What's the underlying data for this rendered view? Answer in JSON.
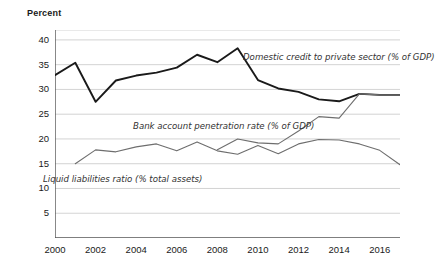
{
  "chart_data": {
    "type": "line",
    "title": "",
    "ylabel": "Percent",
    "xlabel": "",
    "ylim": [
      0,
      42
    ],
    "xlim": [
      2000,
      2017
    ],
    "grid": true,
    "legend_position": "inline-annotations",
    "yticks": [
      5,
      10,
      15,
      20,
      25,
      30,
      35,
      40
    ],
    "xticks": [
      2000,
      2002,
      2004,
      2006,
      2008,
      2010,
      2012,
      2014,
      2016
    ],
    "x": [
      2000,
      2001,
      2002,
      2003,
      2004,
      2005,
      2006,
      2007,
      2008,
      2009,
      2010,
      2011,
      2012,
      2013,
      2014,
      2015,
      2016,
      2017
    ],
    "series": [
      {
        "name": "Domestic credit to private sector (% of GDP)",
        "color": "#1a1a1a",
        "width": 1.9,
        "values": [
          32.9,
          35.4,
          27.5,
          31.8,
          32.8,
          33.4,
          34.4,
          37.0,
          35.5,
          38.3,
          31.9,
          30.2,
          29.5,
          28.0,
          27.6,
          29.1,
          28.9,
          28.9
        ]
      },
      {
        "name": "Bank account penetration rate (% of GDP)",
        "color": "#6e6e6e",
        "width": 1.1,
        "values": [
          null,
          null,
          null,
          null,
          null,
          null,
          null,
          null,
          17.8,
          20.0,
          19.2,
          19.0,
          21.6,
          24.5,
          24.2,
          29.1,
          28.9,
          28.9
        ]
      },
      {
        "name": "Liquid liabilities ratio (% total assets)",
        "color": "#6e6e6e",
        "width": 1.1,
        "values": [
          null,
          15.0,
          17.8,
          17.4,
          18.4,
          19.0,
          17.6,
          19.4,
          17.6,
          16.9,
          18.7,
          17.0,
          19.0,
          19.9,
          19.8,
          19.0,
          17.7,
          14.8
        ]
      }
    ],
    "annotations": [
      {
        "text": "Domestic credit to private sector (% of GDP)",
        "x_px": 243,
        "y_px": 52
      },
      {
        "text": "Bank account penetration rate (% of GDP)",
        "x_px": 133,
        "y_px": 121
      },
      {
        "text": "Liquid liabilities ratio (% total assets)",
        "x_px": 43,
        "y_px": 174
      }
    ]
  },
  "colors": {
    "grid": "#c8c8c8",
    "axis": "#555555",
    "text": "#1a1a1a",
    "series_dark": "#1a1a1a",
    "series_gray": "#6e6e6e"
  }
}
